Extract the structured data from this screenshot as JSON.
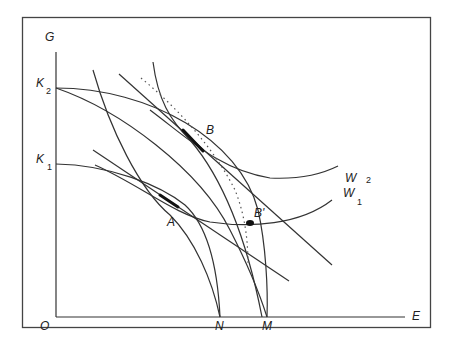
{
  "diagram": {
    "type": "economics-indifference-diagram",
    "axes": {
      "y_label": "G",
      "x_label": "E",
      "origin_label": "O"
    },
    "y_axis_points": [
      {
        "main": "K",
        "sub": "2"
      },
      {
        "main": "K",
        "sub": "1"
      }
    ],
    "x_axis_points": [
      "N",
      "M"
    ],
    "curve_labels": [
      {
        "main": "W",
        "sub": "2"
      },
      {
        "main": "W",
        "sub": "1"
      }
    ],
    "point_labels": {
      "A": "A",
      "B": "B",
      "B_prime": "B'"
    },
    "colors": {
      "stroke": "#333333",
      "frame": "#444444",
      "background": "#ffffff"
    }
  }
}
